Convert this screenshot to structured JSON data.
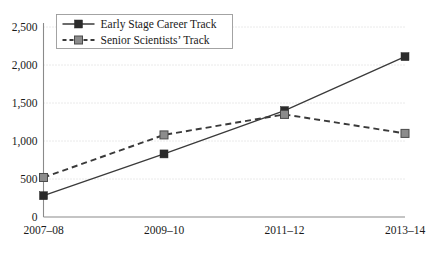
{
  "chart_data": {
    "type": "line",
    "title": "",
    "xlabel": "",
    "ylabel": "",
    "categories": [
      "2007–08",
      "2009–10",
      "2011–12",
      "2013–14"
    ],
    "ylim": [
      0,
      2500
    ],
    "yticks": [
      0,
      500,
      1000,
      1500,
      2000,
      2500
    ],
    "ytick_labels": [
      "0",
      "500",
      "1,000",
      "1,500",
      "2,000",
      "2,500"
    ],
    "grid": true,
    "legend_position": "top-left",
    "series": [
      {
        "name": "Early Stage Career Track",
        "values": [
          280,
          830,
          1400,
          2110
        ],
        "line_style": "solid",
        "color": "#3a3a3a",
        "marker": "square",
        "marker_color": "#2b2b2b"
      },
      {
        "name": "Senior Scientists’ Track",
        "values": [
          520,
          1080,
          1350,
          1100
        ],
        "line_style": "dashed",
        "color": "#3a3a3a",
        "marker": "square",
        "marker_color": "#8c8c8c"
      }
    ]
  },
  "colors": {
    "background": "#ffffff",
    "grid": "#c9c9c9",
    "axis": "#8a8a8a",
    "text": "#1a1a1a",
    "series_early": "#2b2b2b",
    "series_senior": "#8c8c8c"
  }
}
